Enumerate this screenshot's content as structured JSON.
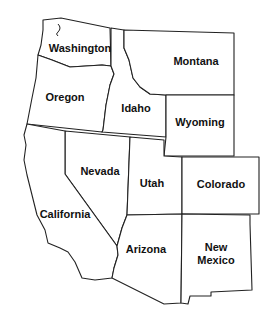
{
  "map": {
    "title": "Western United States",
    "colors": {
      "fill": "#ffffff",
      "stroke": "#222222",
      "text": "#111111"
    },
    "states": [
      {
        "id": "washington",
        "label": "Washington"
      },
      {
        "id": "oregon",
        "label": "Oregon"
      },
      {
        "id": "idaho",
        "label": "Idaho"
      },
      {
        "id": "montana",
        "label": "Montana"
      },
      {
        "id": "wyoming",
        "label": "Wyoming"
      },
      {
        "id": "nevada",
        "label": "Nevada"
      },
      {
        "id": "utah",
        "label": "Utah"
      },
      {
        "id": "colorado",
        "label": "Colorado"
      },
      {
        "id": "california",
        "label": "California"
      },
      {
        "id": "arizona",
        "label": "Arizona"
      },
      {
        "id": "new-mexico",
        "label_line1": "New",
        "label_line2": "Mexico"
      }
    ]
  }
}
